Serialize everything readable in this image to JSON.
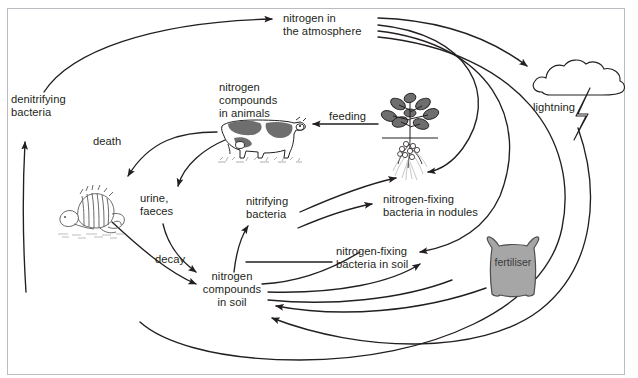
{
  "diagram": {
    "type": "cycle-diagram",
    "border_color": "#b9bcc0",
    "stroke_color": "#231f20",
    "text_color": "#231f20",
    "background": "#ffffff",
    "nodes": [
      {
        "id": "atmosphere",
        "label": "nitrogen in\nthe atmosphere",
        "x": 283,
        "y": 13,
        "align": "left"
      },
      {
        "id": "denitrifying",
        "label": "denitrifying\nbacteria",
        "x": 11,
        "y": 94,
        "align": "left"
      },
      {
        "id": "animals",
        "label": "nitrogen\ncompounds\nin animals",
        "x": 219,
        "y": 82,
        "align": "left"
      },
      {
        "id": "feeding",
        "label": "feeding",
        "x": 329,
        "y": 111,
        "align": "left"
      },
      {
        "id": "lightning",
        "label": "lightning",
        "x": 533,
        "y": 102,
        "align": "left"
      },
      {
        "id": "death",
        "label": "death",
        "x": 93,
        "y": 136,
        "align": "left"
      },
      {
        "id": "urine-faeces",
        "label": "urine,\nfaeces",
        "x": 140,
        "y": 193,
        "align": "left"
      },
      {
        "id": "nitrifying",
        "label": "nitrifying\nbacteria",
        "x": 246,
        "y": 196,
        "align": "left"
      },
      {
        "id": "nf-nodules",
        "label": "nitrogen-fixing\nbacteria in nodules",
        "x": 383,
        "y": 194,
        "align": "left"
      },
      {
        "id": "nf-soil",
        "label": "nitrogen-fixing\nbacteria in soil",
        "x": 336,
        "y": 246,
        "align": "left"
      },
      {
        "id": "decay",
        "label": "decay",
        "x": 155,
        "y": 254,
        "align": "left"
      },
      {
        "id": "soil",
        "label": "nitrogen\ncompounds\nin soil",
        "x": 202,
        "y": 271,
        "align": "center"
      }
    ],
    "pictures": [
      {
        "id": "cow",
        "name": "cow-illustration",
        "x": 218,
        "y": 116
      },
      {
        "id": "plant",
        "name": "legume-plant-illustration",
        "x": 382,
        "y": 94
      },
      {
        "id": "cloud",
        "name": "storm-cloud-illustration",
        "x": 530,
        "y": 58
      },
      {
        "id": "carcass",
        "name": "dead-animal-illustration",
        "x": 58,
        "y": 186
      },
      {
        "id": "fertiliser",
        "name": "fertiliser-sack",
        "x": 484,
        "y": 238
      }
    ],
    "fertiliser": {
      "label": "fertiliser",
      "fill": "#a6a6a6",
      "stroke": "#4d4d4d",
      "label_x": 495,
      "label_y": 262
    },
    "flows": [
      {
        "from": "denitrifying",
        "to": "atmosphere",
        "label": ""
      },
      {
        "from": "atmosphere",
        "to": "lightning",
        "label": ""
      },
      {
        "from": "atmosphere",
        "to": "nf-nodules",
        "label": ""
      },
      {
        "from": "atmosphere",
        "to": "nf-soil",
        "label": ""
      },
      {
        "from": "lightning",
        "to": "soil",
        "label": ""
      },
      {
        "from": "plant",
        "to": "animals",
        "label": "feeding"
      },
      {
        "from": "animals",
        "to": "carcass",
        "label": "death"
      },
      {
        "from": "animals",
        "to": "soil",
        "label": "urine, faeces"
      },
      {
        "from": "carcass",
        "to": "soil",
        "label": "decay"
      },
      {
        "from": "soil",
        "to": "nitrifying",
        "label": ""
      },
      {
        "from": "soil",
        "to": "plant",
        "label": ""
      },
      {
        "from": "soil",
        "to": "nf-nodules",
        "label": ""
      },
      {
        "from": "fertiliser",
        "to": "soil",
        "label": ""
      },
      {
        "from": "nf-soil",
        "to": "soil",
        "label": ""
      },
      {
        "from": "carcass",
        "to": "denitrifying",
        "label": ""
      }
    ]
  }
}
